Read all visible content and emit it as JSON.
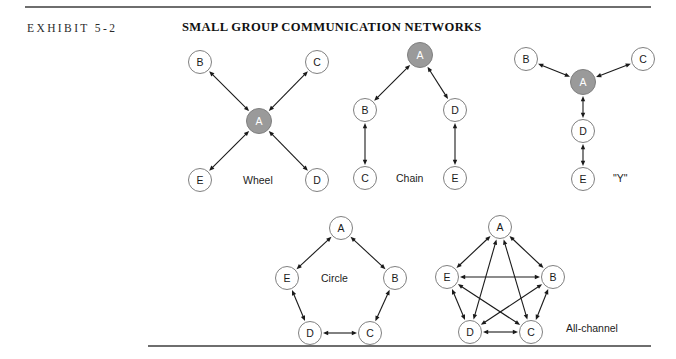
{
  "header": {
    "exhibit_label": "EXHIBIT 5-2",
    "title": "SMALL GROUP COMMUNICATION NETWORKS"
  },
  "colors": {
    "hub_fill": "#9a9a9a",
    "hub_stroke": "#7f7f7f",
    "node_fill": "#ffffff",
    "node_stroke": "#808080",
    "edge": "#1a1a1a",
    "rule": "#6e6e6e",
    "hub_label": "#ffffff",
    "node_label": "#1a1a1a"
  },
  "geometry": {
    "node_radius": 11.5,
    "hub_radius": 12.5,
    "edge_width": 1.1,
    "arrow_size": 5.2
  },
  "networks": [
    {
      "id": "wheel",
      "caption": "Wheel",
      "nodes": [
        {
          "id": "A",
          "label": "A",
          "x": 259,
          "y": 121,
          "hub": true
        },
        {
          "id": "B",
          "label": "B",
          "x": 200,
          "y": 62,
          "hub": false
        },
        {
          "id": "C",
          "label": "C",
          "x": 317,
          "y": 62,
          "hub": false
        },
        {
          "id": "D",
          "label": "D",
          "x": 317,
          "y": 180,
          "hub": false
        },
        {
          "id": "E",
          "label": "E",
          "x": 200,
          "y": 180,
          "hub": false
        }
      ],
      "edges": [
        [
          "A",
          "B"
        ],
        [
          "A",
          "C"
        ],
        [
          "A",
          "D"
        ],
        [
          "A",
          "E"
        ]
      ]
    },
    {
      "id": "chain",
      "caption": "Chain",
      "nodes": [
        {
          "id": "A",
          "label": "A",
          "x": 420,
          "y": 55,
          "hub": true
        },
        {
          "id": "B",
          "label": "B",
          "x": 365,
          "y": 110,
          "hub": false
        },
        {
          "id": "C",
          "label": "C",
          "x": 365,
          "y": 178,
          "hub": false
        },
        {
          "id": "D",
          "label": "D",
          "x": 455,
          "y": 110,
          "hub": false
        },
        {
          "id": "E",
          "label": "E",
          "x": 455,
          "y": 178,
          "hub": false
        }
      ],
      "edges": [
        [
          "A",
          "B"
        ],
        [
          "A",
          "D"
        ],
        [
          "B",
          "C"
        ],
        [
          "D",
          "E"
        ]
      ]
    },
    {
      "id": "y",
      "caption": "\"Y\"",
      "nodes": [
        {
          "id": "A",
          "label": "A",
          "x": 583,
          "y": 82,
          "hub": true
        },
        {
          "id": "B",
          "label": "B",
          "x": 526,
          "y": 59,
          "hub": false
        },
        {
          "id": "C",
          "label": "C",
          "x": 643,
          "y": 59,
          "hub": false
        },
        {
          "id": "D",
          "label": "D",
          "x": 583,
          "y": 131,
          "hub": false
        },
        {
          "id": "E",
          "label": "E",
          "x": 583,
          "y": 179,
          "hub": false
        }
      ],
      "edges": [
        [
          "A",
          "B"
        ],
        [
          "A",
          "C"
        ],
        [
          "A",
          "D"
        ],
        [
          "D",
          "E"
        ]
      ]
    },
    {
      "id": "circle",
      "caption": "Circle",
      "nodes": [
        {
          "id": "A",
          "label": "A",
          "x": 341,
          "y": 228,
          "hub": false
        },
        {
          "id": "B",
          "label": "B",
          "x": 395,
          "y": 278,
          "hub": false
        },
        {
          "id": "C",
          "label": "C",
          "x": 370,
          "y": 333,
          "hub": false
        },
        {
          "id": "D",
          "label": "D",
          "x": 310,
          "y": 333,
          "hub": false
        },
        {
          "id": "E",
          "label": "E",
          "x": 287,
          "y": 278,
          "hub": false
        }
      ],
      "edges": [
        [
          "A",
          "B"
        ],
        [
          "B",
          "C"
        ],
        [
          "C",
          "D"
        ],
        [
          "D",
          "E"
        ],
        [
          "E",
          "A"
        ]
      ]
    },
    {
      "id": "all-channel",
      "caption": "All-channel",
      "nodes": [
        {
          "id": "A",
          "label": "A",
          "x": 500,
          "y": 227,
          "hub": false
        },
        {
          "id": "B",
          "label": "B",
          "x": 553,
          "y": 277,
          "hub": false
        },
        {
          "id": "C",
          "label": "C",
          "x": 531,
          "y": 332,
          "hub": false
        },
        {
          "id": "D",
          "label": "D",
          "x": 470,
          "y": 332,
          "hub": false
        },
        {
          "id": "E",
          "label": "E",
          "x": 447,
          "y": 277,
          "hub": false
        }
      ],
      "edges": [
        [
          "A",
          "B"
        ],
        [
          "A",
          "C"
        ],
        [
          "A",
          "D"
        ],
        [
          "A",
          "E"
        ],
        [
          "B",
          "C"
        ],
        [
          "B",
          "D"
        ],
        [
          "B",
          "E"
        ],
        [
          "C",
          "D"
        ],
        [
          "C",
          "E"
        ],
        [
          "D",
          "E"
        ]
      ]
    }
  ]
}
